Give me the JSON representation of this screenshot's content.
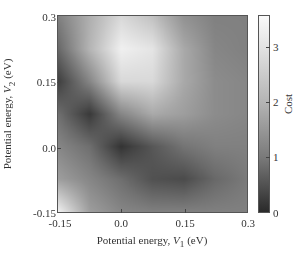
{
  "chart_data": {
    "type": "heatmap",
    "title": "",
    "xlabel": "Potential energy, V1 (eV)",
    "ylabel": "Potential energy, V2 (eV)",
    "xlabel_parts": {
      "pre": "Potential energy, ",
      "var": "V",
      "sub": "1",
      "post": " (eV)"
    },
    "ylabel_parts": {
      "pre": "Potential energy, ",
      "var": "V",
      "sub": "2",
      "post": " (eV)"
    },
    "xlim": [
      -0.15,
      0.3
    ],
    "ylim": [
      -0.15,
      0.3
    ],
    "x_ticks": [
      "-0.15",
      "0.0",
      "0.15",
      "0.3"
    ],
    "y_ticks": [
      "-0.15",
      "0.0",
      "0.15",
      "0.3"
    ],
    "colorbar": {
      "label": "Cost",
      "range": [
        0,
        3.6
      ],
      "ticks": [
        "0",
        "1",
        "2",
        "3"
      ],
      "colormap": "gray"
    },
    "grid": false,
    "x": [
      -0.15,
      -0.075,
      0.0,
      0.075,
      0.15,
      0.225,
      0.3
    ],
    "y": [
      0.3,
      0.225,
      0.15,
      0.075,
      0.0,
      -0.075,
      -0.15
    ],
    "values": [
      [
        1.5,
        2.3,
        3.0,
        2.6,
        1.8,
        1.5,
        1.5
      ],
      [
        1.1,
        2.4,
        3.4,
        3.2,
        2.2,
        1.6,
        1.5
      ],
      [
        0.4,
        1.6,
        3.0,
        3.0,
        2.2,
        1.7,
        1.6
      ],
      [
        1.2,
        0.3,
        1.6,
        2.2,
        2.0,
        1.7,
        1.6
      ],
      [
        1.6,
        1.2,
        0.2,
        0.8,
        1.3,
        1.5,
        1.5
      ],
      [
        2.0,
        1.6,
        1.2,
        0.7,
        0.6,
        1.1,
        1.4
      ],
      [
        3.4,
        2.0,
        1.6,
        1.5,
        1.5,
        1.5,
        1.5
      ]
    ]
  }
}
